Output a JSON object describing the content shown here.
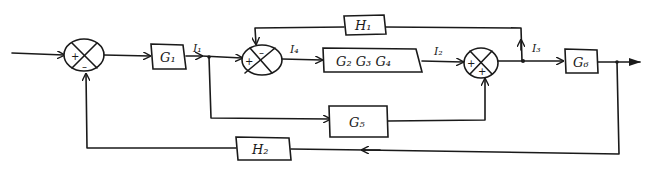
{
  "diagram": {
    "type": "control-system-block-diagram",
    "blocks": {
      "g1": "G₁",
      "g234": "G₂ G₃ G₄",
      "g5": "G₅",
      "g6": "G₆",
      "h1": "H₁",
      "h2": "H₂"
    },
    "signals": {
      "i1": "I₁",
      "i2": "I₂",
      "i3": "I₃",
      "i4": "I₄"
    },
    "summing_junctions": {
      "sj1": {
        "plus": "+",
        "minus": "–"
      },
      "sj2": {
        "plus": "+",
        "minus": "–"
      },
      "sj3": {
        "plus_left": "+",
        "plus_bottom": "+"
      }
    },
    "colors": {
      "ink": "#1a1a1a",
      "background": "#ffffff"
    }
  }
}
